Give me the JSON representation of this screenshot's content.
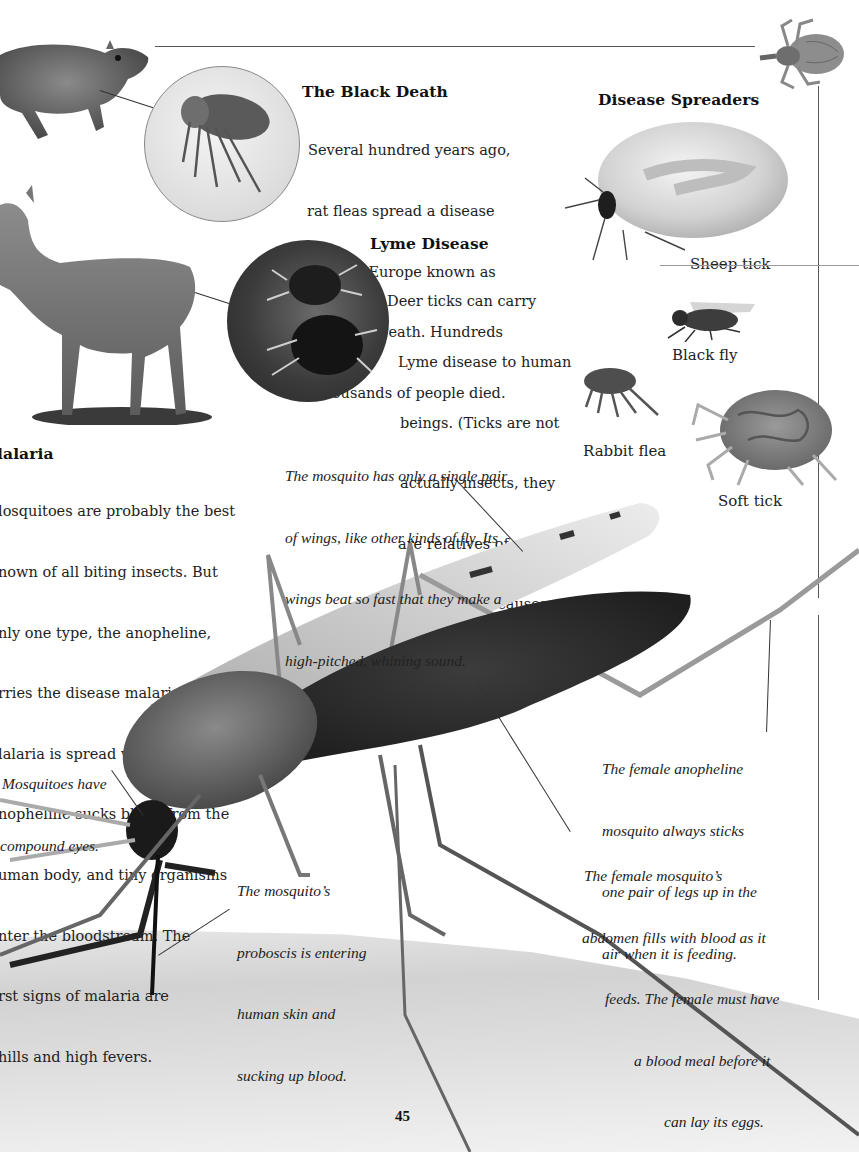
{
  "page": {
    "number": "45",
    "colors": {
      "ink": "#1e1e1e",
      "rule": "#555555",
      "paper": "#ffffff",
      "skin": "#d8d8d8"
    }
  },
  "black_death": {
    "heading": "The Black Death",
    "lines": [
      "Several hundred years ago,",
      "rat fleas spread a disease",
      "through Europe known as",
      "the Black Death. Hundreds",
      "of thousands of people died."
    ]
  },
  "lyme_disease": {
    "heading": "Lyme Disease",
    "lines": [
      "Deer ticks can carry",
      "Lyme disease to human",
      "beings. (Ticks are not",
      "actually insects, they",
      "are relatives of spiders.)",
      "Lyme disease causes",
      "soreness and swelling",
      "of the joints."
    ]
  },
  "malaria": {
    "heading": "Malaria",
    "heading_visible": "lalaria",
    "lines": [
      "Mosquitoes are probably the best",
      "known of all biting insects. But",
      "only one type, the anopheline,",
      "carries the disease malaria.",
      "Malaria is spread when the female",
      "anopheline sucks blood from the",
      "human body, and tiny organisms",
      "enter the bloodstream. The",
      "first signs of malaria are",
      "chills and high fevers."
    ],
    "lines_visible": [
      "losquitoes are probably the best",
      "nown of all biting insects. But",
      "nly one type, the anopheline,",
      "rries the disease malaria.",
      "lalaria is spread when the female",
      "nopheline sucks blood from the",
      "uman body, and tiny organisms",
      "nter the bloodstream. The",
      "rst signs of malaria are",
      "hills and high fevers."
    ]
  },
  "disease_spreaders": {
    "heading": "Disease Spreaders",
    "items": [
      {
        "label": "Sheep tick",
        "icon": "sheep-tick-illustration"
      },
      {
        "label": "Black fly",
        "icon": "black-fly-illustration"
      },
      {
        "label": "Rabbit flea",
        "icon": "rabbit-flea-illustration"
      },
      {
        "label": "Soft tick",
        "icon": "soft-tick-illustration"
      }
    ]
  },
  "captions": {
    "wings": [
      "The mosquito has only a single pair",
      "of wings, like other kinds of fly. Its",
      "wings beat so fast that they make a",
      "high-pitched, whining sound."
    ],
    "eyes": [
      "Mosquitoes have",
      "compound eyes."
    ],
    "proboscis": [
      "The mosquito’s",
      "proboscis is entering",
      "human skin and",
      "sucking up blood."
    ],
    "legs": [
      "The female anopheline",
      "mosquito always sticks",
      "one pair of legs up in the",
      "air when it is feeding."
    ],
    "abdomen": [
      "The female mosquito’s",
      "abdomen fills with blood as it",
      "feeds. The female must have",
      "a blood meal before it",
      "can lay its eggs."
    ]
  },
  "illustrations": {
    "rat": "rat-photo",
    "flea_inset": "rat-flea-inset",
    "deer": "deer-photo",
    "tick_inset": "deer-tick-inset",
    "louse": "louse-illustration",
    "mosquito": "anopheline-mosquito-photo",
    "skin": "human-skin-photo"
  }
}
